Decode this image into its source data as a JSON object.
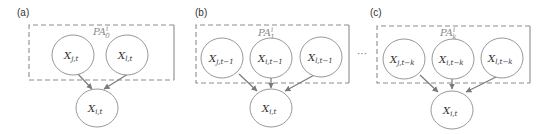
{
  "figure": {
    "ellipsis": "···",
    "colors": {
      "stroke": "#8c8c8c",
      "text": "#333333",
      "pa_label": "#8a8a8a"
    },
    "panels": [
      {
        "label": "(a)",
        "box_label": {
          "base": "PA",
          "sup": "i",
          "sub": "0"
        },
        "parents": [
          {
            "base": "X",
            "sub": "j,t"
          },
          {
            "base": "X",
            "sub": "l,t"
          }
        ],
        "child": {
          "base": "X",
          "sub": "i,t"
        }
      },
      {
        "label": "(b)",
        "box_label": {
          "base": "PA",
          "sup": "i",
          "sub": "1"
        },
        "parents": [
          {
            "base": "X",
            "sub": "j,t−1"
          },
          {
            "base": "X",
            "sub": "i,t−1"
          },
          {
            "base": "X",
            "sub": "l,t−1"
          }
        ],
        "child": {
          "base": "X",
          "sub": "i,t"
        }
      },
      {
        "label": "(c)",
        "box_label": {
          "base": "PA",
          "sup": "i",
          "sub": "k"
        },
        "parents": [
          {
            "base": "X",
            "sub": "j,t−k"
          },
          {
            "base": "X",
            "sub": "i,t−k"
          },
          {
            "base": "X",
            "sub": "l,t−k"
          }
        ],
        "child": {
          "base": "X",
          "sub": "i,t"
        }
      }
    ]
  }
}
